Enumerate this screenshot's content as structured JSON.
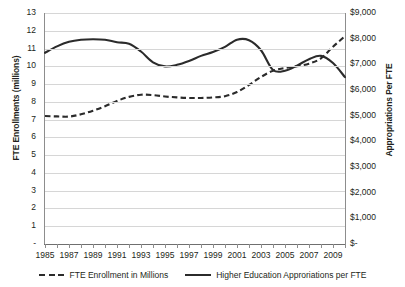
{
  "chart_data": {
    "type": "line",
    "title": "",
    "xlabel": "",
    "x": [
      1985,
      1986,
      1987,
      1988,
      1989,
      1990,
      1991,
      1992,
      1993,
      1994,
      1995,
      1996,
      1997,
      1998,
      1999,
      2000,
      2001,
      2002,
      2003,
      2004,
      2005,
      2006,
      2007,
      2008,
      2009,
      2010
    ],
    "xlim": [
      1985,
      2010
    ],
    "xtick_labels": [
      "1985",
      "1987",
      "1989",
      "1991",
      "1993",
      "1995",
      "1997",
      "1999",
      "2001",
      "2003",
      "2005",
      "2007",
      "2009"
    ],
    "xticks": [
      1985,
      1987,
      1989,
      1991,
      1993,
      1995,
      1997,
      1999,
      2001,
      2003,
      2005,
      2007,
      2009
    ],
    "grid": true,
    "legend_position": "bottom",
    "axes": [
      {
        "id": "left",
        "label": "FTE Enrollments (millions)",
        "lim": [
          0,
          13
        ],
        "ticks": [
          0,
          1,
          2,
          3,
          4,
          5,
          6,
          7,
          8,
          9,
          10,
          11,
          12,
          13
        ],
        "tick_labels": [
          "-",
          "1",
          "2",
          "3",
          "4",
          "5",
          "6",
          "7",
          "8",
          "9",
          "10",
          "11",
          "12",
          "13"
        ]
      },
      {
        "id": "right",
        "label": "Appropriations Per FTE",
        "lim": [
          0,
          9000
        ],
        "ticks": [
          0,
          1000,
          2000,
          3000,
          4000,
          5000,
          6000,
          7000,
          8000,
          9000
        ],
        "tick_labels": [
          "$-",
          "$1,000",
          "$2,000",
          "$3,000",
          "$4,000",
          "$5,000",
          "$6,000",
          "$7,000",
          "$8,000",
          "$9,000"
        ]
      }
    ],
    "series": [
      {
        "name": "FTE Enrollment in Millions",
        "style": "dashed",
        "axis": "left",
        "unit": "millions",
        "color": "#2b2b2b",
        "values": [
          7.2,
          7.18,
          7.17,
          7.3,
          7.5,
          7.75,
          8.05,
          8.28,
          8.4,
          8.38,
          8.3,
          8.25,
          8.22,
          8.22,
          8.25,
          8.32,
          8.55,
          8.95,
          9.4,
          9.75,
          9.9,
          10.0,
          10.15,
          10.45,
          11.1,
          11.7
        ]
      },
      {
        "name": "Higher Education Approriations per FTE",
        "style": "solid",
        "axis": "right",
        "unit": "dollars",
        "color": "#2b2b2b",
        "values": [
          7450,
          7700,
          7880,
          7960,
          7980,
          7960,
          7860,
          7800,
          7500,
          7080,
          6920,
          6980,
          7130,
          7330,
          7480,
          7680,
          7960,
          7940,
          7550,
          6780,
          6750,
          6950,
          7200,
          7330,
          7050,
          6500
        ]
      }
    ]
  },
  "legend": {
    "items": [
      {
        "label": "FTE Enrollment in Millions",
        "style": "dashed"
      },
      {
        "label": "Higher Education Approriations per FTE",
        "style": "solid"
      }
    ]
  }
}
